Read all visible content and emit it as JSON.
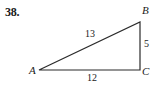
{
  "problem": {
    "number": "38."
  },
  "figure": {
    "type": "right-triangle",
    "stroke_color": "#2b2b2b",
    "background_color": "#ffffff",
    "vertices": [
      {
        "label": "A",
        "x": 39,
        "y": 70
      },
      {
        "label": "B",
        "x": 140,
        "y": 22
      },
      {
        "label": "C",
        "x": 140,
        "y": 70
      }
    ],
    "sides": [
      {
        "name": "hypotenuse-AB",
        "label": "13"
      },
      {
        "name": "leg-BC",
        "label": "5"
      },
      {
        "name": "leg-AC",
        "label": "12"
      }
    ],
    "vertex_labels": {
      "A": "A",
      "B": "B",
      "C": "C"
    },
    "side_labels": {
      "AB": "13",
      "BC": "5",
      "AC": "12"
    }
  }
}
